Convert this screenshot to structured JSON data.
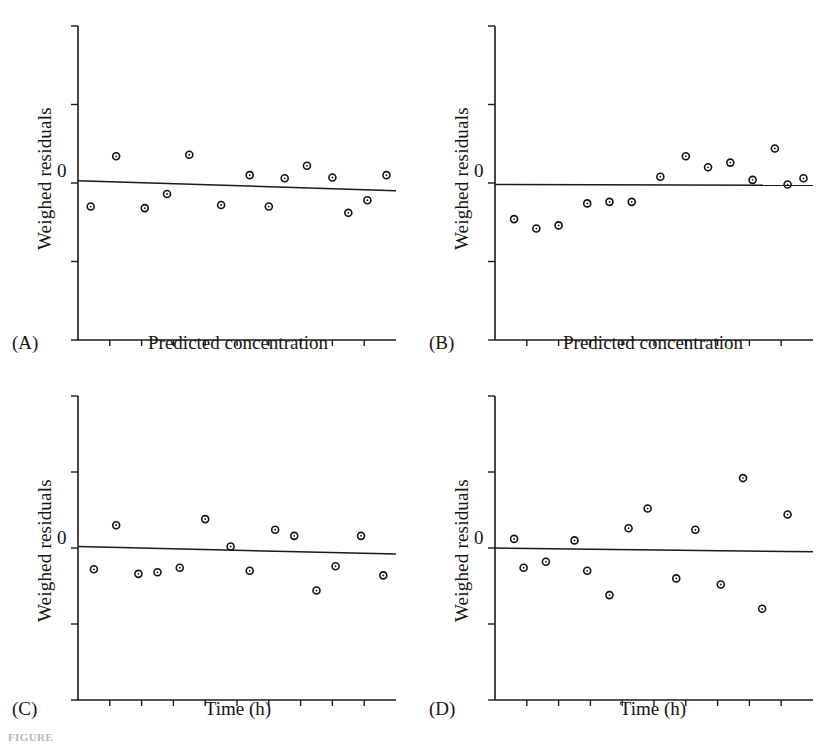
{
  "figure": {
    "caption_fragment": "FIGURE",
    "marker_shape": "open-circle",
    "axis_color": "#1a1a1a",
    "point_color": "#111111",
    "line_color": "#1a1a1a",
    "background": "#ffffff"
  },
  "labels": {
    "y_axis": "Weighed residuals",
    "zero_tick": "0",
    "x_axis_concentration": "Predicted concentration",
    "x_axis_time": "Time (h)",
    "tag_a": "(A)",
    "tag_b": "(B)",
    "tag_c": "(C)",
    "tag_d": "(D)"
  },
  "chart_data": [
    {
      "id": "A",
      "type": "scatter",
      "title": "(A)",
      "xlabel": "Predicted concentration",
      "ylabel": "Weighed residuals",
      "ytick_labels": [
        "0"
      ],
      "xtick_labels": [],
      "n_yticks": 5,
      "n_xticks": 9,
      "grid": false,
      "legend": false,
      "xlim": [
        0,
        100
      ],
      "ylim": [
        -2,
        2
      ],
      "pattern": "random scatter about zero",
      "x": [
        4,
        12,
        21,
        28,
        35,
        45,
        54,
        60,
        65,
        72,
        80,
        85,
        91,
        97
      ],
      "y": [
        -0.3,
        0.34,
        -0.32,
        -0.14,
        0.36,
        -0.28,
        0.1,
        -0.3,
        0.06,
        0.22,
        0.07,
        -0.38,
        -0.22,
        0.1
      ],
      "trend_line": {
        "x0": 0,
        "y0": 0.03,
        "x1": 100,
        "y1": -0.1
      }
    },
    {
      "id": "B",
      "type": "scatter",
      "title": "(B)",
      "xlabel": "Predicted concentration",
      "ylabel": "Weighed residuals",
      "ytick_labels": [
        "0"
      ],
      "xtick_labels": [],
      "n_yticks": 5,
      "n_xticks": 9,
      "grid": false,
      "legend": false,
      "xlim": [
        0,
        100
      ],
      "ylim": [
        -2,
        2
      ],
      "pattern": "systematic bias: negative then positive",
      "x": [
        6,
        13,
        20,
        29,
        36,
        43,
        52,
        60,
        67,
        74,
        81,
        88,
        92,
        97
      ],
      "y": [
        -0.46,
        -0.58,
        -0.54,
        -0.26,
        -0.24,
        -0.24,
        0.08,
        0.34,
        0.2,
        0.26,
        0.04,
        0.44,
        -0.02,
        0.06
      ],
      "trend_line": {
        "x0": 0,
        "y0": -0.02,
        "x1": 100,
        "y1": -0.03
      }
    },
    {
      "id": "C",
      "type": "scatter",
      "title": "(C)",
      "xlabel": "Time (h)",
      "ylabel": "Weighed residuals",
      "ytick_labels": [
        "0"
      ],
      "xtick_labels": [],
      "n_yticks": 5,
      "n_xticks": 9,
      "grid": false,
      "legend": false,
      "xlim": [
        0,
        100
      ],
      "ylim": [
        -2,
        2
      ],
      "pattern": "random scatter about zero",
      "x": [
        5,
        12,
        19,
        25,
        32,
        40,
        48,
        54,
        62,
        68,
        75,
        81,
        89,
        96
      ],
      "y": [
        -0.28,
        0.3,
        -0.34,
        -0.32,
        -0.26,
        0.38,
        0.02,
        -0.3,
        0.24,
        0.16,
        -0.56,
        -0.24,
        0.16,
        -0.36
      ],
      "trend_line": {
        "x0": 0,
        "y0": 0.02,
        "x1": 100,
        "y1": -0.08
      }
    },
    {
      "id": "D",
      "type": "scatter",
      "title": "(D)",
      "xlabel": "Time (h)",
      "ylabel": "Weighed residuals",
      "ytick_labels": [
        "0"
      ],
      "xtick_labels": [],
      "n_yticks": 5,
      "n_xticks": 9,
      "grid": false,
      "legend": false,
      "xlim": [
        0,
        100
      ],
      "ylim": [
        -2,
        2
      ],
      "pattern": "increasing variance (funnel / heteroscedasticity)",
      "x": [
        6,
        9,
        16,
        25,
        29,
        36,
        42,
        48,
        57,
        63,
        71,
        78,
        84,
        92
      ],
      "y": [
        0.12,
        -0.26,
        -0.18,
        0.1,
        -0.3,
        -0.62,
        0.26,
        0.52,
        -0.4,
        0.24,
        -0.48,
        0.92,
        -0.8,
        0.44
      ],
      "trend_line": {
        "x0": 0,
        "y0": 0.0,
        "x1": 100,
        "y1": -0.05
      }
    }
  ]
}
